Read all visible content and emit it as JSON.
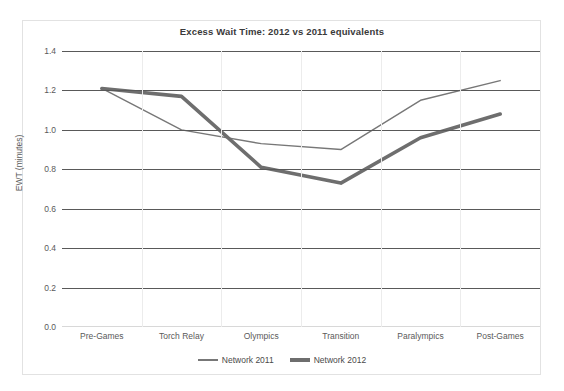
{
  "chart_data": {
    "type": "line",
    "title": "Excess Wait Time: 2012 vs 2011 equivalents",
    "xlabel": "",
    "ylabel": "EWT (minutes)",
    "categories": [
      "Pre-Games",
      "Torch Relay",
      "Olympics",
      "Transition",
      "Paralympics",
      "Post-Games"
    ],
    "series": [
      {
        "name": "Network 2011",
        "values": [
          1.21,
          1.0,
          0.93,
          0.9,
          1.15,
          1.25
        ],
        "color": "#777777",
        "width": 1.4
      },
      {
        "name": "Network 2012",
        "values": [
          1.21,
          1.17,
          0.81,
          0.73,
          0.96,
          1.08
        ],
        "color": "#6e6e6e",
        "width": 3.6
      }
    ],
    "ylim": [
      0.0,
      1.4
    ],
    "ytick_labels": [
      "1.4",
      "1.2",
      "1.0",
      "0.8",
      "0.6",
      "0.4",
      "0.2",
      "0.0"
    ],
    "ytick_values": [
      1.4,
      1.2,
      1.0,
      0.8,
      0.6,
      0.4,
      0.2,
      0.0
    ],
    "grid": true,
    "grid_axis": "y",
    "legend_position": "bottom"
  },
  "legend": {
    "items": [
      {
        "label": "Network 2011",
        "style": "thin"
      },
      {
        "label": "Network 2012",
        "style": "thick"
      }
    ]
  },
  "colors": {
    "series_2011": "#777777",
    "series_2012": "#6e6e6e",
    "gridline": "#595959",
    "frame": "#e2e2e2",
    "text": "#5a5a5a"
  }
}
